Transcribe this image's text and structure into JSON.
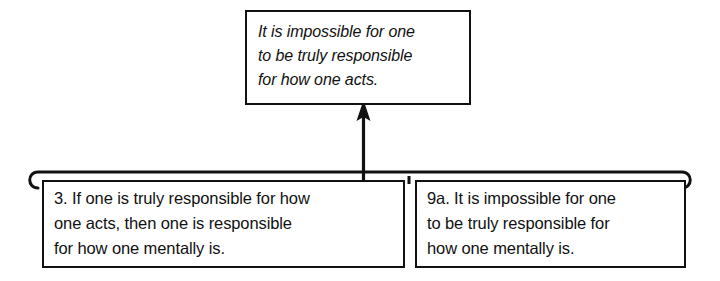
{
  "diagram": {
    "type": "argument-map",
    "background_color": "#ffffff",
    "line_color": "#111111",
    "conclusion": {
      "id": "conclusion",
      "label": "It is impossible for one\nto be truly responsible\nfor how one acts.",
      "style": "italic"
    },
    "premises": [
      {
        "id": "premise-3",
        "number": "3",
        "label": "3. If one is truly responsible for how\none acts, then one is responsible\nfor how one mentally is."
      },
      {
        "id": "premise-9a",
        "number": "9a",
        "label": "9a. It is impossible for one\nto be truly responsible for\nhow one mentally is."
      }
    ],
    "connectors": [
      {
        "id": "linked-premise-bracket",
        "kind": "bracket",
        "joins": [
          "premise-3",
          "premise-9a"
        ]
      },
      {
        "id": "inference-arrow",
        "kind": "arrow",
        "from": "linked-premise-bracket",
        "to": "conclusion"
      }
    ]
  }
}
